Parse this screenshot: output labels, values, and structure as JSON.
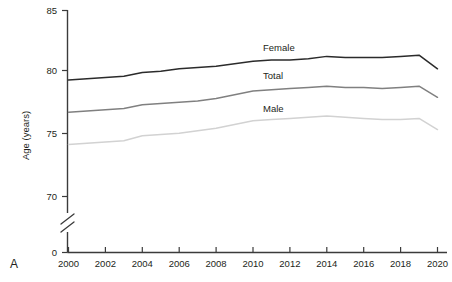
{
  "panel": {
    "label": "A"
  },
  "chart_data": {
    "type": "line",
    "title": "",
    "xlabel": "",
    "ylabel": "Age (years)",
    "xlim": [
      2000,
      2020
    ],
    "ylim": [
      70,
      85
    ],
    "y_axis_break": true,
    "y_break_below": 70,
    "y_baseline_label": "0",
    "grid": false,
    "legend": "inline-labels",
    "x": [
      2000,
      2001,
      2002,
      2003,
      2004,
      2005,
      2006,
      2007,
      2008,
      2009,
      2010,
      2011,
      2012,
      2013,
      2014,
      2015,
      2016,
      2017,
      2018,
      2019,
      2020
    ],
    "xticks": [
      2000,
      2002,
      2004,
      2006,
      2008,
      2010,
      2012,
      2014,
      2016,
      2018,
      2020
    ],
    "xtick_labels": [
      "2000",
      "2002",
      "2004",
      "2006",
      "2008",
      "2010",
      "2012",
      "2014",
      "2016",
      "2018",
      "2020"
    ],
    "yticks": [
      70,
      75,
      80,
      85
    ],
    "ytick_labels": [
      "70",
      "75",
      "80",
      "85"
    ],
    "series": [
      {
        "name": "Female",
        "color": "#2b2b2b",
        "label": "Female",
        "values": [
          79.4,
          79.5,
          79.6,
          79.7,
          80.0,
          80.1,
          80.3,
          80.4,
          80.5,
          80.7,
          80.9,
          81.0,
          81.0,
          81.1,
          81.3,
          81.2,
          81.2,
          81.2,
          81.3,
          81.4,
          80.3
        ]
      },
      {
        "name": "Total",
        "color": "#808080",
        "label": "Total",
        "values": [
          76.8,
          76.9,
          77.0,
          77.1,
          77.4,
          77.5,
          77.6,
          77.7,
          77.9,
          78.2,
          78.5,
          78.6,
          78.7,
          78.8,
          78.9,
          78.8,
          78.8,
          78.7,
          78.8,
          78.9,
          78.0
        ]
      },
      {
        "name": "Male",
        "color": "#d2d2d2",
        "label": "Male",
        "values": [
          74.2,
          74.3,
          74.4,
          74.5,
          74.9,
          75.0,
          75.1,
          75.3,
          75.5,
          75.8,
          76.1,
          76.2,
          76.3,
          76.4,
          76.5,
          76.4,
          76.3,
          76.2,
          76.2,
          76.3,
          75.4
        ]
      }
    ],
    "series_label_positions": [
      {
        "name": "Female",
        "x": 2015.6,
        "y_px": 47
      },
      {
        "name": "Total",
        "x": 2015.6,
        "y_px": 75
      },
      {
        "name": "Male",
        "x": 2015.6,
        "y_px": 108
      }
    ]
  }
}
